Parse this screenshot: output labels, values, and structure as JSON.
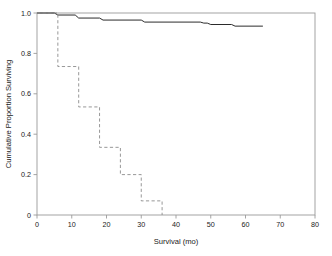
{
  "chart_data": {
    "type": "line",
    "title": "",
    "xlabel": "Survival (mo)",
    "ylabel": "Cumulative Proportion Surviving",
    "xlim": [
      0,
      80
    ],
    "ylim": [
      0,
      1.0
    ],
    "grid": false,
    "legend": "none",
    "x_ticks": [
      "0",
      "10",
      "20",
      "30",
      "40",
      "50",
      "60",
      "70",
      "80"
    ],
    "x_tick_values": [
      0,
      10,
      20,
      30,
      40,
      50,
      60,
      70,
      80
    ],
    "y_ticks": [
      "0",
      "0.2",
      "0.4",
      "0.6",
      "0.8",
      "1.0"
    ],
    "y_tick_values": [
      0,
      0.2,
      0.4,
      0.6,
      0.8,
      1.0
    ],
    "series": [
      {
        "name": "solid-curve",
        "style": "solid",
        "color": "#2b2b2b",
        "step": "post",
        "x": [
          0,
          5,
          6,
          11,
          12,
          18,
          19,
          30,
          31,
          47,
          48,
          49,
          50,
          56,
          57,
          65
        ],
        "y": [
          1.0,
          1.0,
          0.99,
          0.99,
          0.975,
          0.975,
          0.965,
          0.965,
          0.955,
          0.955,
          0.95,
          0.95,
          0.943,
          0.943,
          0.935,
          0.935
        ]
      },
      {
        "name": "dashed-curve",
        "style": "dashed",
        "color": "#8c8c8c",
        "step": "post",
        "x": [
          0,
          6,
          6,
          12,
          12,
          18,
          18,
          24,
          24,
          30,
          30,
          36,
          36
        ],
        "y": [
          1.0,
          1.0,
          0.735,
          0.735,
          0.535,
          0.535,
          0.335,
          0.335,
          0.2,
          0.2,
          0.07,
          0.07,
          0.0
        ]
      }
    ]
  }
}
